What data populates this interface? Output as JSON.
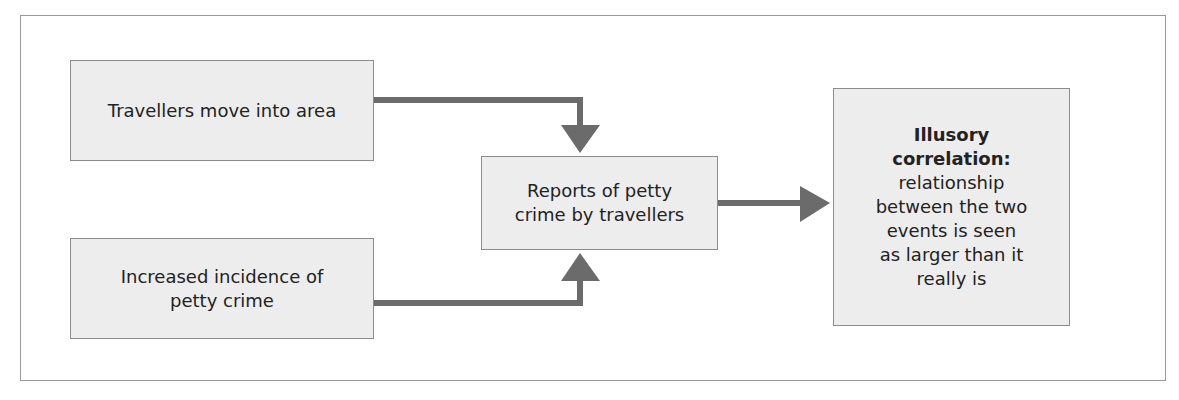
{
  "diagram": {
    "boxes": {
      "travellers": {
        "lines": [
          "Travellers move into area"
        ]
      },
      "crime": {
        "lines": [
          "Increased incidence of",
          "petty crime"
        ]
      },
      "reports": {
        "lines": [
          "Reports of petty",
          "crime by travellers"
        ]
      },
      "illusory": {
        "title_lines": [
          "Illusory",
          "correlation:"
        ],
        "body_lines": [
          "relationship",
          "between the two",
          "events is seen",
          "as larger than it",
          "really is"
        ]
      }
    },
    "colors": {
      "box_fill": "#ededed",
      "box_border": "#8c8c8c",
      "arrow": "#6b6b6b",
      "frame": "#9a9a9a"
    },
    "arrows": [
      {
        "from": "travellers",
        "to": "reports"
      },
      {
        "from": "crime",
        "to": "reports"
      },
      {
        "from": "reports",
        "to": "illusory"
      }
    ]
  }
}
